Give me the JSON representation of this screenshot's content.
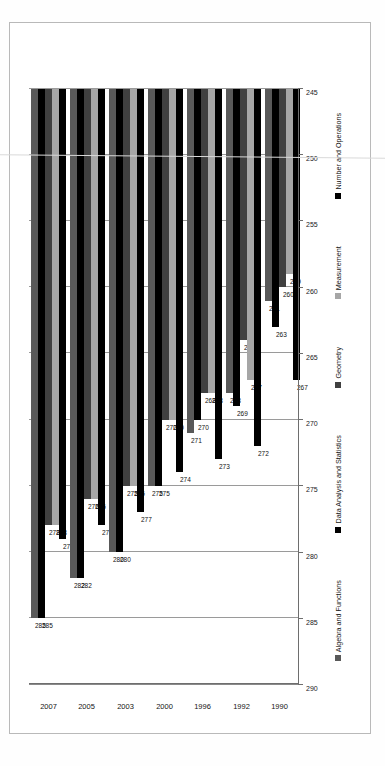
{
  "chart_data": {
    "type": "bar",
    "orientation": "horizontal",
    "title": "",
    "subtitle": "",
    "xlabel": "",
    "ylabel": "",
    "categories": [
      "1990",
      "1992",
      "1996",
      "2000",
      "2003",
      "2005",
      "2007"
    ],
    "series": [
      {
        "name": "Number and Operations",
        "color": "#000000",
        "values": [
          267,
          272,
          273,
          274,
          277,
          278,
          279
        ]
      },
      {
        "name": "Measurement",
        "color": "#a6a6a6",
        "values": [
          259,
          267,
          268,
          270,
          275,
          276,
          278
        ]
      },
      {
        "name": "Geometry",
        "color": "#404040",
        "values": [
          260,
          264,
          268,
          270,
          275,
          276,
          278
        ]
      },
      {
        "name": "Data Analysis and Statistics",
        "color": "#000000",
        "values": [
          263,
          269,
          270,
          275,
          280,
          282,
          285
        ]
      },
      {
        "name": "Algebra and Functions",
        "color": "#595959",
        "values": [
          261,
          268,
          271,
          275,
          280,
          282,
          285
        ]
      }
    ],
    "xlim": [
      245,
      290
    ],
    "x_reversed": true,
    "xticks": [
      "290",
      "285",
      "280",
      "275",
      "270",
      "265",
      "260",
      "255",
      "250",
      "245"
    ],
    "grid": true,
    "legend_position": "bottom",
    "legend_marker": "■"
  },
  "labels": {
    "group_1990": [
      "267",
      "259",
      "260",
      "263",
      "261"
    ],
    "group_1992": [
      "272",
      "267",
      "264",
      "269",
      "268"
    ],
    "group_1996": [
      "273",
      "268",
      "268",
      "270",
      "271"
    ],
    "group_2000": [
      "274",
      "270",
      "270",
      "275",
      "275"
    ],
    "group_2003": [
      "277",
      "275",
      "275",
      "280",
      "280"
    ],
    "group_2005": [
      "278",
      "276",
      "276",
      "282",
      "282"
    ],
    "group_2007": [
      "279",
      "278",
      "278",
      "285",
      "285"
    ]
  }
}
